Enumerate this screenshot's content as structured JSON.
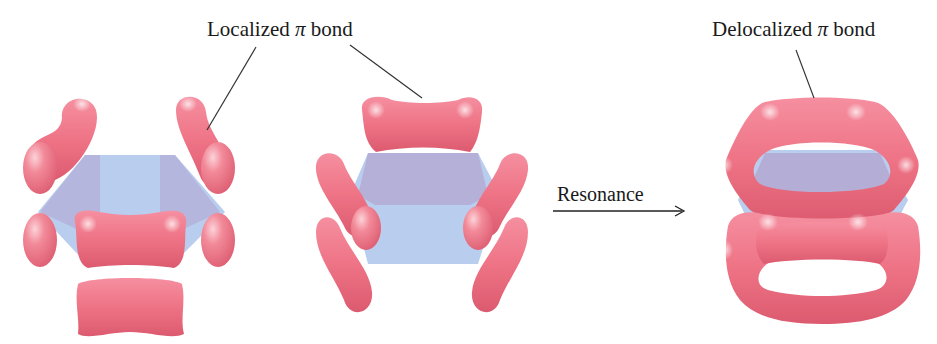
{
  "figure": {
    "labels": {
      "localized": {
        "prefix": "Localized ",
        "symbol": "π",
        "suffix": " bond"
      },
      "delocalized": {
        "prefix": "Delocalized ",
        "symbol": "π",
        "suffix": " bond"
      },
      "resonance": "Resonance"
    },
    "structures": [
      {
        "id": "kekule-1",
        "description": "Benzene p-orbital overlap, localized π bonds (structure 1)"
      },
      {
        "id": "kekule-2",
        "description": "Benzene p-orbital overlap, localized π bonds (structure 2)"
      },
      {
        "id": "resonance-hybrid",
        "description": "Benzene delocalized π system (resonance hybrid)"
      }
    ],
    "colors": {
      "lobe": "#ee7587",
      "lobe_dark": "#d9566b",
      "lobe_highlight": "#fbd0d6",
      "ring_plane": "#b9cdef",
      "ring_plane_shadow": "#b3a6d0",
      "text": "#1a1a1a",
      "leader_line": "#333333"
    }
  }
}
